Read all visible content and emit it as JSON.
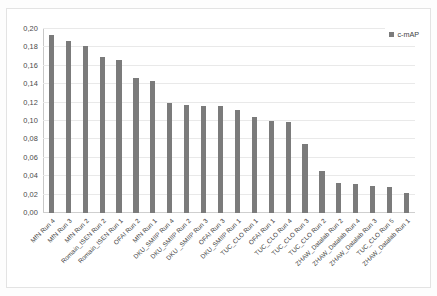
{
  "chart_data": {
    "type": "bar",
    "title": "",
    "xlabel": "",
    "ylabel": "",
    "ylim": [
      0,
      0.2
    ],
    "ytick_labels": [
      "0,20",
      "0,18",
      "0,16",
      "0,14",
      "0,12",
      "0,10",
      "0,08",
      "0,06",
      "0,04",
      "0,02",
      "0,00"
    ],
    "ytick_values": [
      0.2,
      0.18,
      0.16,
      0.14,
      0.12,
      0.1,
      0.08,
      0.06,
      0.04,
      0.02,
      0.0
    ],
    "grid": true,
    "legend_position": "top-right",
    "legend": [
      "c-mAP"
    ],
    "series_name": "c-mAP",
    "bar_color": "#7b7b7b",
    "categories": [
      "MfN Run 4",
      "MfN Run 3",
      "MfN Run 2",
      "Romain_ISEN Run 2",
      "Romain_ISEN Run 1",
      "OFAI Run 2",
      "MfN Run 1",
      "DKU_SMIIP Run 4",
      "DKU_SMIIP Run 2",
      "DKU _SMIIP Run 3",
      "OFAI Run 3",
      "DKU_SMIIP Run 1",
      "TUC_CLO Run 1",
      "OFAI Run 1",
      "TUC_CLO Run 4",
      "TUC_CLO Run 3",
      "TUC_CLO Run 2",
      "ZHAW_Datalab Run 2",
      "ZHAW_Datalab Run 4",
      "ZHAW_Datalab Run 3",
      "TUC_CLO Run 5",
      "ZHAW_Datalab Run 1"
    ],
    "values": [
      0.193,
      0.187,
      0.181,
      0.17,
      0.166,
      0.147,
      0.144,
      0.12,
      0.117,
      0.116,
      0.116,
      0.112,
      0.104,
      0.1,
      0.099,
      0.075,
      0.046,
      0.033,
      0.032,
      0.029,
      0.028,
      0.022
    ]
  },
  "legend": {
    "label": "c-mAP"
  }
}
